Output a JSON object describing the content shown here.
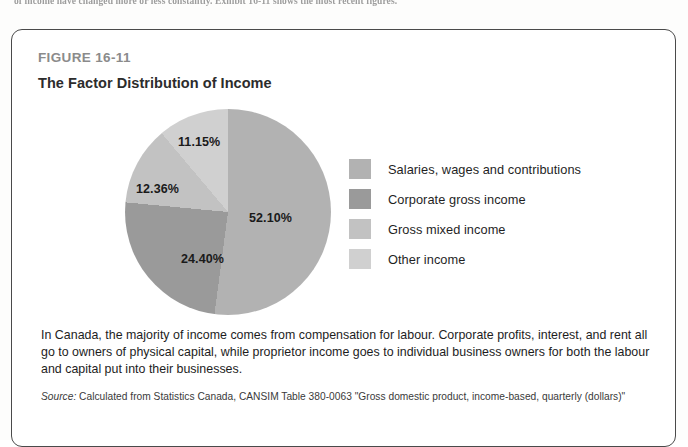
{
  "page": {
    "bleed_text": "of income have changed more or less constantly. Exhibit 16-11 shows the most recent figures."
  },
  "figure": {
    "label": "FIGURE 16-11",
    "title": "The Factor Distribution of Income",
    "caption": "In Canada, the majority of income comes from compensation for labour. Corporate profits, interest, and rent all go to owners of physical capital, while proprietor income goes to individual business owners for both the labour and capital put into their businesses.",
    "source_word": "Source:",
    "source_text": " Calculated from Statistics Canada, CANSIM Table 380-0063 \"Gross domestic product, income-based, quarterly (dollars)\""
  },
  "chart_data": {
    "type": "pie",
    "title": "The Factor Distribution of Income",
    "categories": [
      "Salaries, wages and contributions",
      "Corporate gross income",
      "Gross mixed income",
      "Other income"
    ],
    "values": [
      52.1,
      24.4,
      12.36,
      11.15
    ],
    "labels": [
      "52.10%",
      "24.40%",
      "12.36%",
      "11.15%"
    ],
    "colors": [
      "#b2b2b2",
      "#9a9a9a",
      "#c2c2c2",
      "#d0d0d0"
    ],
    "start_angle": 0,
    "direction": "clockwise",
    "legend_position": "right",
    "grid": false
  },
  "legend": {
    "items": [
      {
        "label": "Salaries, wages and contributions",
        "color": "#b2b2b2"
      },
      {
        "label": "Corporate gross income",
        "color": "#9a9a9a"
      },
      {
        "label": "Gross mixed income",
        "color": "#c2c2c2"
      },
      {
        "label": "Other income",
        "color": "#d0d0d0"
      }
    ]
  }
}
